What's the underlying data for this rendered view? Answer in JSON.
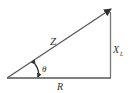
{
  "diagram": {
    "labels": {
      "hypotenuse": "Z",
      "vertical": "X",
      "vertical_subscript": "L",
      "base": "R",
      "angle": "θ"
    },
    "colors": {
      "line": "#555555",
      "arrow": "#333333",
      "text": "#333333"
    }
  }
}
